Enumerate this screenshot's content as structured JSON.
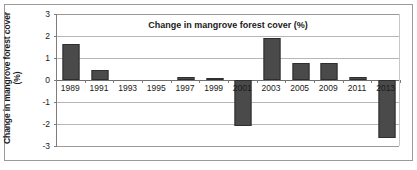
{
  "chart_data": {
    "type": "bar",
    "title": "Change in mangrove forest cover (%)",
    "xlabel": "",
    "ylabel": "Change in mangrove forest cover (%)",
    "ylabel_line1": "Change in mangrove forest cover",
    "ylabel_line2": "(%)",
    "categories": [
      "1989",
      "1991",
      "1993",
      "1995",
      "1997",
      "1999",
      "2001",
      "2003",
      "2005",
      "2009",
      "2011",
      "2013"
    ],
    "values": [
      1.62,
      0.45,
      0,
      0,
      0.15,
      0.08,
      -2.1,
      1.9,
      0.78,
      0.78,
      0.12,
      -2.65
    ],
    "ylim": [
      -3,
      3
    ],
    "ytick_labels": [
      "3",
      "2",
      "1",
      "0",
      "-1",
      "-2",
      "-3"
    ],
    "ytick_values": [
      3,
      2,
      1,
      0,
      -1,
      -2,
      -3
    ],
    "grid": true,
    "legend": "none",
    "bar_color": "#4a4a4a",
    "bar_border_color": "#2e2e2e",
    "gridline_color": "#b6b6b6",
    "axis_color": "#7d7d7d",
    "frame_color": "#9a9a9a",
    "background": "#ffffff"
  }
}
